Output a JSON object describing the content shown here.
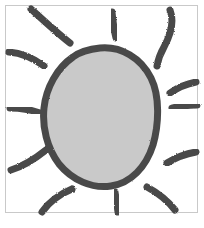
{
  "document": {
    "title": "Hand-drawn sun sketch",
    "caption": "Sun with circular disc and radiating rays",
    "width": 204,
    "height": 228,
    "background_color": "#ffffff"
  },
  "frame": {
    "label": "image-border",
    "stroke_color": "#c9c9c9",
    "stroke_width": 1,
    "x": 5.5,
    "y": 5.5,
    "width": 192,
    "height": 207
  },
  "sun": {
    "label": "sun",
    "disc": {
      "label": "sun-disc",
      "fill_color": "#c9c9c9",
      "outline_color": "#4a4a4a",
      "outline_width": 7,
      "center_x": 100,
      "center_y": 117,
      "radius_x": 56,
      "radius_y": 66,
      "path": "M 100 48 C 121 46 141 58 151 78 C 160 96 159 124 153 145 C 146 167 131 183 111 186 C 92 189 72 180 59 164 C 47 148 42 127 44 108 C 46 88 57 68 73 57 C 81 51 90 49 100 48 Z"
    },
    "rays": [
      {
        "id": "ray-top-left-outer",
        "label": "ray-top-left-outer",
        "angle_deg": 200,
        "path": "M 31 9 C 43 20 56 32 70 43"
      },
      {
        "id": "ray-top-left-inner",
        "label": "ray-top-left-inner",
        "angle_deg": 225,
        "path": "M 9 52 C 21 53 33 58 44 66"
      },
      {
        "id": "ray-top-center",
        "label": "ray-top-center",
        "angle_deg": 270,
        "path": "M 112 12 C 113 22 114 30 116 38"
      },
      {
        "id": "ray-top-right",
        "label": "ray-top-right",
        "angle_deg": 320,
        "path": "M 170 10 C 175 23 170 36 164 47 C 160 54 158 60 157 66"
      },
      {
        "id": "ray-left-upper",
        "label": "ray-left-upper",
        "angle_deg": 180,
        "path": "M 10 108 C 22 108 32 110 40 113"
      },
      {
        "id": "ray-left-lower",
        "label": "ray-left-lower",
        "angle_deg": 150,
        "path": "M 11 170 C 24 166 36 158 46 150"
      },
      {
        "id": "ray-right-upper",
        "label": "ray-right-upper",
        "angle_deg": 30,
        "path": "M 196 82 C 186 84 177 88 170 93"
      },
      {
        "id": "ray-right-middle",
        "label": "ray-right-middle",
        "angle_deg": 10,
        "path": "M 197 105 C 187 105 179 106 172 108"
      },
      {
        "id": "ray-right-lower",
        "label": "ray-right-lower",
        "angle_deg": 335,
        "path": "M 196 152 C 185 154 175 158 167 163"
      },
      {
        "id": "ray-bottom-right",
        "label": "ray-bottom-right",
        "angle_deg": 300,
        "path": "M 175 210 C 168 201 158 193 147 187"
      },
      {
        "id": "ray-bottom-center",
        "label": "ray-bottom-center",
        "angle_deg": 90,
        "path": "M 118 212 C 117 204 116 198 115 192"
      },
      {
        "id": "ray-bottom-left",
        "label": "ray-bottom-left",
        "angle_deg": 60,
        "path": "M 42 212 C 49 202 60 194 72 189"
      }
    ],
    "ray_stroke_color": "#4a4a4a",
    "ray_stroke_width": 7
  }
}
